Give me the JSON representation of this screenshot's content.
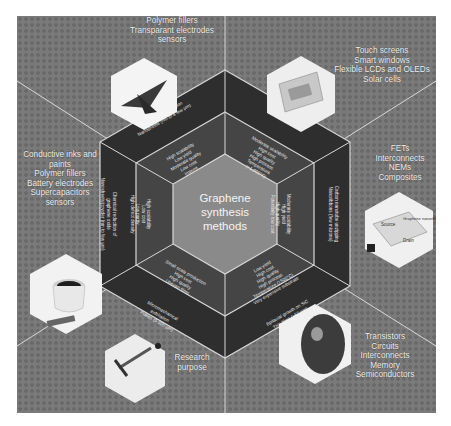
{
  "title": {
    "line1": "Graphene",
    "line2": "synthesis",
    "line3": "methods"
  },
  "methods": [
    {
      "id": "liquid-phase-exfoliation",
      "outer": [
        "Liquid phase exfoliation",
        "Nanosheets (nm to a few μm)"
      ],
      "inner": [
        "High scalability",
        "Low yield",
        "Moderate quality",
        "Low cost",
        "Impure"
      ]
    },
    {
      "id": "cvd",
      "outer": [
        "CVD (on Ni, Cu, Co)",
        "Thin films (≤75 cm)"
      ],
      "inner": [
        "Moderate scalability",
        "High cost",
        "High quality",
        "High process",
        "Temperature",
        "(>1,000°C)"
      ]
    },
    {
      "id": "carbon-nanotube-unzipping",
      "outer": [
        "Carbon nanotube unzipping",
        "Nanoribbons (few microns)"
      ],
      "inner": [
        "Moderate scalability",
        "High yield",
        "High quality",
        "Potentially low cost"
      ]
    },
    {
      "id": "epitaxial-growth-sic",
      "outer": [
        "Epitaxial growth on SiC",
        "Thin films (≥50 μm)"
      ],
      "inner": [
        "Low yield",
        "High cost",
        "High quality",
        "High process",
        "Temperature (1500°C)",
        "Very expensive substrate"
      ]
    },
    {
      "id": "micromechanical-exfoliation",
      "outer": [
        "Micromechanical",
        "exfoliation",
        "Flakes (5-100 μm)"
      ],
      "inner": [
        "Small scale production",
        "High cost",
        "High quality",
        "Uneven films"
      ]
    },
    {
      "id": "chemical-reduction-graphene-oxide",
      "outer": [
        "Chemical reduction of",
        "graphene oxide",
        "Nanosheets/powder (nm to few μm)"
      ],
      "inner": [
        "High scalability",
        "Low cost",
        "Low purity",
        "High defect density"
      ]
    }
  ],
  "applications": [
    {
      "id": "top",
      "lines": [
        "Polymer fillers",
        "Transparant electrodes",
        "sensors"
      ],
      "image": "aircraft-model"
    },
    {
      "id": "top-right",
      "lines": [
        "Touch screens",
        "Smart windows",
        "Flexible LCDs and OLEDs",
        "Solar cells"
      ],
      "image": "flexible-display"
    },
    {
      "id": "right",
      "lines": [
        "FETs",
        "Interconnects",
        "NEMs",
        "Composites"
      ],
      "image": "graphene-nanoribbon-device",
      "image_labels": [
        "Source",
        "Graphene nanoribbon",
        "Drain"
      ]
    },
    {
      "id": "bottom-right",
      "lines": [
        "Transistors",
        "Circuits",
        "Interconnects",
        "Memory",
        "Semiconductors"
      ],
      "image": "finger-touch"
    },
    {
      "id": "bottom-left",
      "lines": [
        "Research",
        "purpose"
      ],
      "image": "microscope"
    },
    {
      "id": "left",
      "lines": [
        "Conductive inks and",
        "paints",
        "Polymer fillers",
        "Battery electrodes",
        "Supercapacitors",
        "sensors"
      ],
      "image": "ink-cup"
    }
  ],
  "colors": {
    "background": "#7a7a7a",
    "outer_ring": "#2e2e2e",
    "inner_ring": "#454545",
    "center": "#8a8a8a",
    "divider": "#d8d8d8",
    "text": "#f2f2f2"
  }
}
